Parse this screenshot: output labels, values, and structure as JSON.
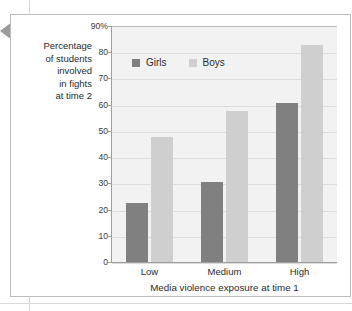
{
  "figure": {
    "arrow_marker": "left-pointing-triangle"
  },
  "chart_data": {
    "type": "bar",
    "title": "",
    "categories": [
      "Low",
      "Medium",
      "High"
    ],
    "series": [
      {
        "name": "Girls",
        "values": [
          23,
          31,
          61
        ],
        "color": "#808080"
      },
      {
        "name": "Boys",
        "values": [
          48,
          58,
          83
        ],
        "color": "#cfcfcf"
      }
    ],
    "xlabel": "Media violence exposure at time 1",
    "ylabel": "Percentage of students involved in fights at time 2",
    "ylabel_lines": [
      "Percentage",
      "of students",
      "involved",
      "in fights",
      "at time 2"
    ],
    "ylim": [
      0,
      90
    ],
    "ytick_values": [
      0,
      10,
      20,
      30,
      40,
      50,
      60,
      70,
      80,
      90
    ],
    "ytick_labels": [
      "0",
      "10",
      "20",
      "30",
      "40",
      "50",
      "60",
      "70",
      "80",
      "90%"
    ],
    "grid": true,
    "grid_axis": "y",
    "legend_position": "upper-left-inside",
    "legend": [
      "Girls",
      "Boys"
    ],
    "plot_background": "#f2f2f2"
  }
}
